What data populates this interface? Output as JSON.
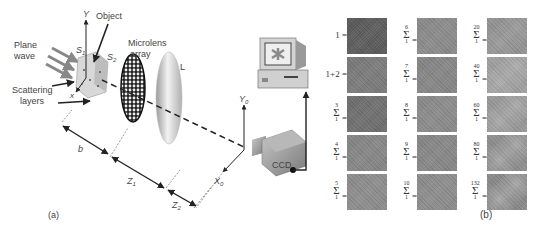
{
  "panel_a": {
    "caption": "(a)",
    "labels": {
      "plane_wave": [
        "Plane",
        "wave"
      ],
      "object": "Object",
      "scattering_layers": [
        "Scattering",
        "layers"
      ],
      "microlens_array": [
        "Microlens",
        "array"
      ],
      "lens": "L",
      "s1": "S",
      "s1_sub": "1",
      "s2": "S",
      "s2_sub": "2",
      "y_axis": "Y",
      "x_axis": "x",
      "y0_axis": "Y",
      "y0_sub": "0",
      "x0_axis": "X",
      "x0_sub": "0",
      "b": "b",
      "z1": "Z",
      "z1_sub": "1",
      "z2": "Z",
      "z2_sub": "2",
      "ccd": "CCD"
    }
  },
  "panel_b": {
    "caption": "(b)",
    "columns": [
      [
        {
          "label": "1 =",
          "type": "plain",
          "shade": "#5a5a5a"
        },
        {
          "label": "1+2 =",
          "type": "plain",
          "shade": "#7a7a7a"
        },
        {
          "upper": "3",
          "lower": "1",
          "type": "sum",
          "shade": "#6e6e6e"
        },
        {
          "upper": "4",
          "lower": "1",
          "type": "sum",
          "shade": "#858585"
        },
        {
          "upper": "5",
          "lower": "1",
          "type": "sum",
          "shade": "#8c8c8c"
        }
      ],
      [
        {
          "upper": "6",
          "lower": "1",
          "type": "sum",
          "shade": "#8a8a8a"
        },
        {
          "upper": "7",
          "lower": "1",
          "type": "sum",
          "shade": "#858585"
        },
        {
          "upper": "8",
          "lower": "1",
          "type": "sum",
          "shade": "#8a8a8a"
        },
        {
          "upper": "9",
          "lower": "1",
          "type": "sum",
          "shade": "#868686"
        },
        {
          "upper": "10",
          "lower": "1",
          "type": "sum",
          "shade": "#8c8c8c"
        }
      ],
      [
        {
          "upper": "20",
          "lower": "1",
          "type": "sum",
          "shade": "#939393"
        },
        {
          "upper": "40",
          "lower": "1",
          "type": "sum",
          "shade": "#a0a0a0"
        },
        {
          "upper": "60",
          "lower": "1",
          "type": "sum",
          "shade": "#999999"
        },
        {
          "upper": "80",
          "lower": "1",
          "type": "sum",
          "shade": "#8f8f8f"
        },
        {
          "upper": "132",
          "lower": "1",
          "type": "sum",
          "shade": "#8a8a8a"
        }
      ]
    ]
  }
}
